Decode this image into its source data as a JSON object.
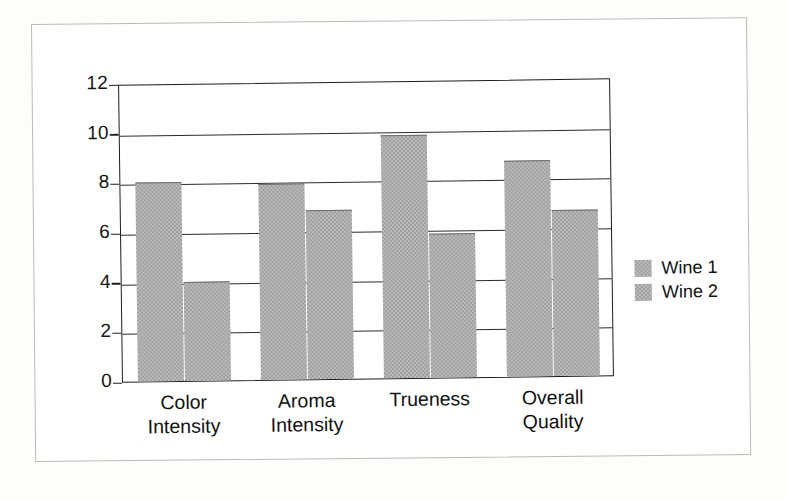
{
  "chart_data": {
    "type": "bar",
    "title": "",
    "subtitle": "",
    "xlabel": "",
    "ylabel": "",
    "categories": [
      "Color\nIntensity",
      "Aroma\nIntensity",
      "Trueness",
      "Overall\nQuality"
    ],
    "series": [
      {
        "name": "Wine 1",
        "values": [
          8.0,
          7.9,
          9.8,
          8.7
        ],
        "color": "#9d9d9d"
      },
      {
        "name": "Wine 2",
        "values": [
          4.0,
          6.8,
          5.8,
          6.7
        ],
        "color": "#9d9d9d"
      }
    ],
    "ylim": [
      0,
      12
    ],
    "yticks": [
      0,
      2,
      4,
      6,
      8,
      10,
      12
    ],
    "ytick_labels": [
      "0",
      "2",
      "4",
      "6",
      "8",
      "10",
      "12"
    ],
    "grid": true,
    "grid_axis": "y",
    "legend_position": "right",
    "bar_style": "grouped"
  },
  "axis": {
    "y_labels": [
      "12",
      "10",
      "8",
      "6",
      "4",
      "2",
      "0"
    ]
  },
  "legend": {
    "entries": [
      {
        "label": "Wine 1"
      },
      {
        "label": "Wine 2"
      }
    ]
  },
  "categories_display": [
    "Color\nIntensity",
    "Aroma\nIntensity",
    "Trueness",
    "Overall\nQuality"
  ],
  "colors": {
    "bar_fill": "#9d9d9d",
    "axis_line": "#1d1d1d",
    "gridline": "#2b2b2b",
    "frame": "#b9bbb9",
    "text": "#111111",
    "background": "#ffffff"
  }
}
